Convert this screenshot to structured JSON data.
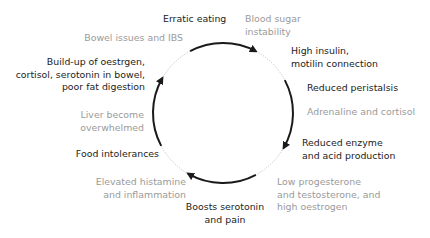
{
  "diagram": {
    "type": "cycle",
    "direction": "clockwise",
    "colors": {
      "dark_text": "#1c1c1c",
      "light_text": "#9a9a9a",
      "arrow": "#1a1a1a",
      "circle_dotted": "#b0b0b0"
    },
    "nodes": [
      {
        "id": "erratic-eating",
        "label": "Erratic eating",
        "style": "dark"
      },
      {
        "id": "blood-sugar",
        "label": [
          "Blood sugar",
          "instability"
        ],
        "style": "light"
      },
      {
        "id": "high-insulin",
        "label": [
          "High insulin,",
          "motilin connection"
        ],
        "style": "dark"
      },
      {
        "id": "reduced-peristalsis",
        "label": "Reduced peristalsis",
        "style": "dark"
      },
      {
        "id": "adrenaline",
        "label": "Adrenaline and cortisol",
        "style": "light"
      },
      {
        "id": "reduced-enzyme",
        "label": [
          "Reduced enzyme",
          "and acid production"
        ],
        "style": "dark"
      },
      {
        "id": "low-progesterone",
        "label": [
          "Low progesterone",
          "and testosterone, and",
          "high oestrogen"
        ],
        "style": "light"
      },
      {
        "id": "boosts-serotonin",
        "label": [
          "Boosts serotonin",
          "and pain"
        ],
        "style": "dark"
      },
      {
        "id": "elevated-histamine",
        "label": [
          "Elevated histamine",
          "and inflammation"
        ],
        "style": "light"
      },
      {
        "id": "food-intolerances",
        "label": "Food intolerances",
        "style": "dark"
      },
      {
        "id": "liver-overwhelmed",
        "label": [
          "Liver become",
          "overwhelmed"
        ],
        "style": "light"
      },
      {
        "id": "build-up",
        "label": [
          "Build-up of oestrgen,",
          "cortisol, serotonin in bowel,",
          "poor fat digestion"
        ],
        "style": "dark"
      },
      {
        "id": "bowel-issues",
        "label": "Bowel issues and IBS",
        "style": "light"
      }
    ],
    "circle": {
      "cx": 223,
      "cy": 113,
      "r": 70
    }
  }
}
